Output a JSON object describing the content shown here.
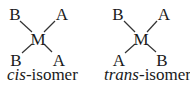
{
  "diagrams": [
    {
      "id": "cis",
      "center": "M",
      "ligands": {
        "top_left": "B",
        "top_right": "A",
        "bottom_left": "B",
        "bottom_right": "A"
      },
      "caption": {
        "prefix": "cis",
        "suffix": "-isomer"
      }
    },
    {
      "id": "trans",
      "center": "M",
      "ligands": {
        "top_left": "B",
        "top_right": "A",
        "bottom_left": "A",
        "bottom_right": "B"
      },
      "caption": {
        "prefix": "trans",
        "suffix": "-isomer"
      }
    }
  ],
  "colors": {
    "text": "#1a1a1a",
    "bond": "#333333",
    "background": "#ffffff"
  }
}
